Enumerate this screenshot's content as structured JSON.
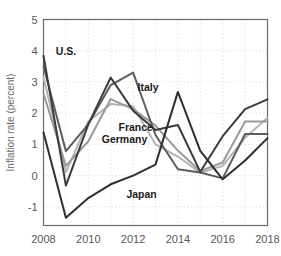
{
  "chart_data": {
    "type": "line",
    "title": "",
    "xlabel": "",
    "ylabel": "Inflation rate (percent)",
    "xlim": [
      2008,
      2018
    ],
    "ylim": [
      -1.6,
      5
    ],
    "grid": true,
    "legend": "inline-labels",
    "x": [
      2008,
      2009,
      2010,
      2011,
      2012,
      2013,
      2014,
      2015,
      2016,
      2017,
      2018
    ],
    "xticks": [
      2008,
      2010,
      2012,
      2014,
      2016,
      2018
    ],
    "xtick_labels": [
      "2008",
      "2010",
      "2012",
      "2014",
      "2016",
      "2018"
    ],
    "minor_xticks": [
      2009,
      2011,
      2013,
      2015,
      2017
    ],
    "yticks": [
      -1,
      0,
      1,
      2,
      3,
      4,
      5
    ],
    "ytick_labels": [
      "-1",
      "0",
      "1",
      "2",
      "3",
      "4",
      "5"
    ],
    "series": [
      {
        "name": "U.S.",
        "color": "#3b3b3b",
        "label_x": 2008.55,
        "label_y": 3.85,
        "values": [
          3.84,
          -0.32,
          1.64,
          3.14,
          2.08,
          1.46,
          1.62,
          0.12,
          1.26,
          2.13,
          2.44
        ]
      },
      {
        "name": "Italy",
        "color": "#5d5d5d",
        "label_x": 2012.2,
        "label_y": 2.72,
        "values": [
          3.5,
          0.78,
          1.64,
          2.9,
          3.3,
          1.3,
          0.2,
          0.1,
          -0.09,
          1.33,
          1.33
        ]
      },
      {
        "name": "France",
        "color": "#b4b4b4",
        "label_x": 2011.35,
        "label_y": 1.43,
        "values": [
          3.16,
          0.1,
          1.74,
          2.29,
          2.22,
          1.0,
          0.61,
          0.09,
          0.31,
          1.21,
          1.85
        ]
      },
      {
        "name": "Germany",
        "color": "#9a9a9a",
        "label_x": 2010.6,
        "label_y": 1.04,
        "values": [
          2.63,
          0.31,
          1.1,
          2.45,
          2.13,
          1.6,
          0.8,
          0.14,
          0.42,
          1.73,
          1.73
        ]
      },
      {
        "name": "Japan",
        "color": "#2e2e2e",
        "label_x": 2011.7,
        "label_y": -0.72,
        "values": [
          1.38,
          -1.35,
          -0.72,
          -0.28,
          0.0,
          0.35,
          2.68,
          0.79,
          -0.12,
          0.48,
          1.2
        ]
      }
    ]
  }
}
